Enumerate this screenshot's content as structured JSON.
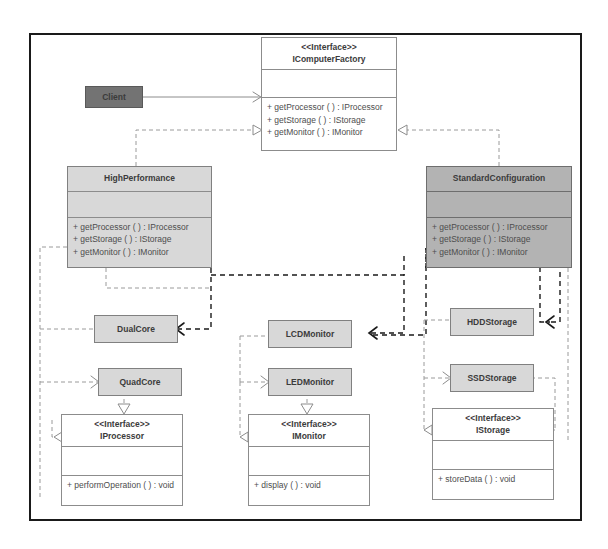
{
  "diagram": {
    "colors": {
      "frame_border": "#1a1a1a",
      "interface_fill": "#ffffff",
      "concrete_fill": "#d8d8d8",
      "factory_fill": "#b3b3b3",
      "client_fill": "#737373",
      "text": "#4d4d4d",
      "dependency_dark": "#1a1a1a",
      "realization_light": "#9a9a9a"
    },
    "stereotype": "<<Interface>>"
  },
  "client": {
    "name": "Client"
  },
  "icomputerfactory": {
    "stereotype": "<<Interface>>",
    "name": "IComputerFactory",
    "operations": [
      "+ getProcessor ( )  : IProcessor",
      "+ getStorage ( )  : IStorage",
      "+ getMonitor ( ) : IMonitor"
    ]
  },
  "highperformance": {
    "name": "HighPerformance",
    "operations": [
      "+ getProcessor ( )  : IProcessor",
      "+ getStorage ( )  : IStorage",
      "+ getMonitor ( ) : IMonitor"
    ]
  },
  "standardconfiguration": {
    "name": "StandardConfiguration",
    "operations": [
      "+ getProcessor ( )  : IProcessor",
      "+ getStorage ( )  : IStorage",
      "+ getMonitor ( ) : IMonitor"
    ]
  },
  "dualcore": {
    "name": "DualCore"
  },
  "quadcore": {
    "name": "QuadCore"
  },
  "lcdmonitor": {
    "name": "LCDMonitor"
  },
  "ledmonitor": {
    "name": "LEDMonitor"
  },
  "hddstorage": {
    "name": "HDDStorage"
  },
  "ssdstorage": {
    "name": "SSDStorage"
  },
  "iprocessor": {
    "stereotype": "<<Interface>>",
    "name": "IProcessor",
    "operations": [
      "+ performOperation ( )   : void"
    ]
  },
  "imonitor": {
    "stereotype": "<<Interface>>",
    "name": "IMonitor",
    "operations": [
      "+ display  ( )  : void"
    ]
  },
  "istorage": {
    "stereotype": "<<Interface>>",
    "name": "IStorage",
    "operations": [
      "+ storeData ( )   : void"
    ]
  }
}
